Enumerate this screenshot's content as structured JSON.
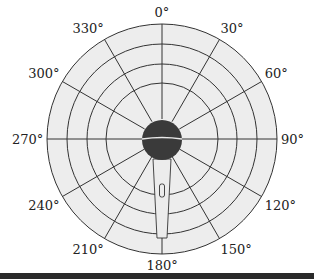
{
  "diagram": {
    "type": "polar-pickup-pattern",
    "colors": {
      "disc_fill": "#ededed",
      "grid_line": "#333333",
      "mic_head": "#3a3a3a",
      "mic_band": "#e8e8e8",
      "bottom_bar": "#2a2a2a"
    },
    "rings": 4,
    "spoke_interval_deg": 30,
    "angle_labels": [
      {
        "text": "0°",
        "deg": 0
      },
      {
        "text": "30°",
        "deg": 30
      },
      {
        "text": "60°",
        "deg": 60
      },
      {
        "text": "90°",
        "deg": 90
      },
      {
        "text": "120°",
        "deg": 120
      },
      {
        "text": "150°",
        "deg": 150
      },
      {
        "text": "180°",
        "deg": 180
      },
      {
        "text": "210°",
        "deg": 210
      },
      {
        "text": "240°",
        "deg": 240
      },
      {
        "text": "270°",
        "deg": 270
      },
      {
        "text": "300°",
        "deg": 300
      },
      {
        "text": "330°",
        "deg": 330
      }
    ]
  }
}
